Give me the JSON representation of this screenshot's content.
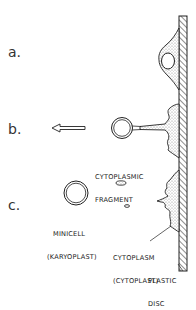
{
  "steps": [
    {
      "label": "a."
    },
    {
      "label": "b."
    },
    {
      "label": "c."
    }
  ],
  "labels": {
    "cytoplasmic_fragment": [
      "CYTOPLASMIC",
      "FRAGMENT"
    ],
    "minicell": [
      "MINICELL",
      "(KARYOPLAST)"
    ],
    "cytoplasm": [
      "CYTOPLASM",
      "(CYTOPLAST)"
    ],
    "plastic_disc": [
      "PLASTIC",
      "DISC"
    ]
  },
  "colors": {
    "line": "#222222",
    "stipple": "#9a9a9a",
    "background": "#ffffff"
  }
}
